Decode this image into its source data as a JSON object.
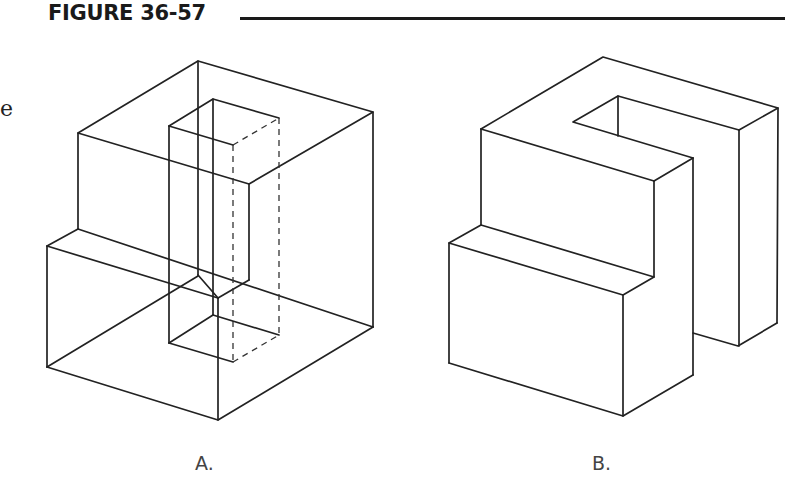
{
  "header": {
    "figure_title": "FIGURE 36-57"
  },
  "margin_text": "e",
  "figures": [
    {
      "id": "A",
      "label": "A.",
      "description": "Wireframe isometric cube with stepped lower front and a rectangular through-slot, hidden edges dashed"
    },
    {
      "id": "B",
      "label": "B.",
      "description": "Solid isometric view of the same part showing the step and a notch at the top"
    }
  ],
  "colors": {
    "line": "#222222",
    "background": "#ffffff"
  }
}
